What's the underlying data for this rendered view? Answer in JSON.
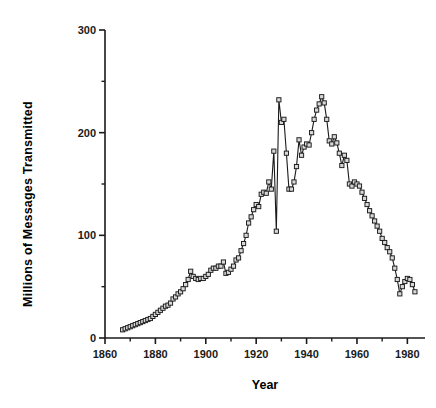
{
  "chart_data": {
    "type": "line",
    "title": "",
    "xlabel": "Year",
    "ylabel": "Millions of Messages Transmitted",
    "xlim": [
      1860,
      1987
    ],
    "ylim": [
      0,
      300
    ],
    "grid": false,
    "legend": null,
    "marker": "open-square",
    "x_major_ticks": [
      1860,
      1880,
      1900,
      1920,
      1940,
      1960,
      1980
    ],
    "x_major_tick_labels": [
      "1860",
      "1880",
      "1900",
      "1920",
      "1940",
      "1960",
      "1980"
    ],
    "x_minor_ticks": [
      1870,
      1890,
      1910,
      1930,
      1950,
      1970
    ],
    "y_major_ticks": [
      0,
      100,
      200,
      300
    ],
    "y_major_tick_labels": [
      "0",
      "100",
      "200",
      "300"
    ],
    "y_minor_ticks": [
      50,
      150,
      250
    ],
    "series": [
      {
        "name": "Telegraph messages",
        "x": [
          1867,
          1868,
          1869,
          1870,
          1871,
          1872,
          1873,
          1874,
          1875,
          1876,
          1877,
          1878,
          1879,
          1880,
          1881,
          1882,
          1883,
          1884,
          1885,
          1886,
          1887,
          1888,
          1889,
          1890,
          1891,
          1892,
          1893,
          1894,
          1895,
          1896,
          1897,
          1898,
          1899,
          1900,
          1901,
          1902,
          1903,
          1904,
          1905,
          1906,
          1907,
          1908,
          1909,
          1910,
          1911,
          1912,
          1913,
          1914,
          1915,
          1916,
          1917,
          1918,
          1919,
          1920,
          1921,
          1922,
          1923,
          1924,
          1925,
          1926,
          1927,
          1928,
          1929,
          1930,
          1931,
          1932,
          1933,
          1934,
          1935,
          1936,
          1937,
          1938,
          1939,
          1940,
          1941,
          1942,
          1943,
          1944,
          1945,
          1946,
          1947,
          1948,
          1949,
          1950,
          1951,
          1952,
          1953,
          1954,
          1955,
          1956,
          1957,
          1958,
          1959,
          1960,
          1961,
          1962,
          1963,
          1964,
          1965,
          1966,
          1967,
          1968,
          1969,
          1970,
          1971,
          1972,
          1973,
          1974,
          1975,
          1976,
          1977,
          1978,
          1979,
          1980,
          1981,
          1982,
          1983
        ],
        "y": [
          8,
          9,
          10,
          11,
          12,
          13,
          14,
          15,
          16,
          17,
          18,
          19,
          21,
          23,
          25,
          27,
          29,
          31,
          32,
          34,
          38,
          40,
          43,
          45,
          48,
          52,
          57,
          65,
          60,
          58,
          57,
          58,
          58,
          60,
          62,
          66,
          68,
          68,
          70,
          70,
          74,
          63,
          64,
          67,
          70,
          76,
          78,
          85,
          92,
          100,
          112,
          118,
          125,
          130,
          128,
          140,
          142,
          141,
          152,
          145,
          182,
          104,
          232,
          210,
          213,
          180,
          145,
          145,
          152,
          167,
          193,
          178,
          186,
          189,
          188,
          200,
          213,
          222,
          228,
          235,
          229,
          213,
          192,
          189,
          196,
          190,
          180,
          168,
          178,
          173,
          150,
          148,
          152,
          150,
          148,
          142,
          136,
          130,
          124,
          119,
          114,
          109,
          104,
          97,
          93,
          88,
          84,
          78,
          68,
          57,
          43,
          50,
          55,
          58,
          57,
          52,
          45
        ]
      }
    ]
  },
  "axis": {
    "x_title": "Year",
    "y_title": "Millions of Messages Transmitted"
  },
  "colors": {
    "line": "#1a1a1a",
    "marker_fill": "#d8d8d8",
    "marker_stroke": "#1a1a1a",
    "axis": "#1a1a1a",
    "background": "#ffffff"
  }
}
